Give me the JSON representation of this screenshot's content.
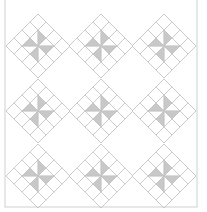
{
  "diagram": {
    "type": "quilt-pattern",
    "frame": {
      "x": 5,
      "y": -2,
      "width": 192,
      "height": 209,
      "stroke": "#cfcfcf"
    },
    "colors": {
      "line": "#c4c4c4",
      "shade": "#c8c8c8",
      "background": "#ffffff"
    },
    "block": {
      "half_diagonal": 32,
      "grid": 4
    },
    "blocks": [
      {
        "cx": 38,
        "cy": 46
      },
      {
        "cx": 101,
        "cy": 46
      },
      {
        "cx": 164,
        "cy": 46
      },
      {
        "cx": 38,
        "cy": 111
      },
      {
        "cx": 101,
        "cy": 111
      },
      {
        "cx": 164,
        "cy": 111
      },
      {
        "cx": 38,
        "cy": 176
      },
      {
        "cx": 101,
        "cy": 176
      },
      {
        "cx": 164,
        "cy": 176
      }
    ]
  }
}
